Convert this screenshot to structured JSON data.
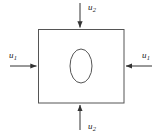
{
  "figure": {
    "name": "plate-with-elliptical-hole-biaxial-loading",
    "background_color": "#ffffff",
    "stroke_color": "#3a3a3a",
    "text_color": "#1a1a1a"
  },
  "plate": {
    "shape": "rectangle",
    "x": 38,
    "y": 29,
    "width": 86,
    "height": 74,
    "fill": "#ffffff",
    "stroke": "#555555",
    "stroke_width": 1
  },
  "hole": {
    "shape": "ellipse",
    "cx": 81,
    "cy": 66,
    "rx": 11,
    "ry": 17,
    "fill": "#ffffff",
    "stroke": "#555555",
    "stroke_width": 1
  },
  "loads": [
    {
      "id": "top",
      "symbol": "u",
      "subscript": "2",
      "label": "u2",
      "direction": "down",
      "points_inward": true,
      "arrow": {
        "x1": 80,
        "y1": 3,
        "x2": 80,
        "y2": 28
      },
      "label_x": 88,
      "label_y": 3
    },
    {
      "id": "bottom",
      "symbol": "u",
      "subscript": "2",
      "label": "u2",
      "direction": "up",
      "points_inward": true,
      "arrow": {
        "x1": 80,
        "y1": 130,
        "x2": 80,
        "y2": 104
      },
      "label_x": 88,
      "label_y": 122
    },
    {
      "id": "left",
      "symbol": "u",
      "subscript": "1",
      "label": "u1",
      "direction": "right",
      "points_inward": true,
      "arrow": {
        "x1": 10,
        "y1": 66,
        "x2": 37,
        "y2": 66
      },
      "label_x": 9,
      "label_y": 51
    },
    {
      "id": "right",
      "symbol": "u",
      "subscript": "1",
      "label": "u1",
      "direction": "left",
      "points_inward": true,
      "arrow": {
        "x1": 152,
        "y1": 66,
        "x2": 125,
        "y2": 66
      },
      "label_x": 142,
      "label_y": 51
    }
  ],
  "labels": {
    "top": {
      "symbol": "u",
      "sub": "2"
    },
    "bottom": {
      "symbol": "u",
      "sub": "2"
    },
    "left": {
      "symbol": "u",
      "sub": "1"
    },
    "right": {
      "symbol": "u",
      "sub": "1"
    }
  }
}
